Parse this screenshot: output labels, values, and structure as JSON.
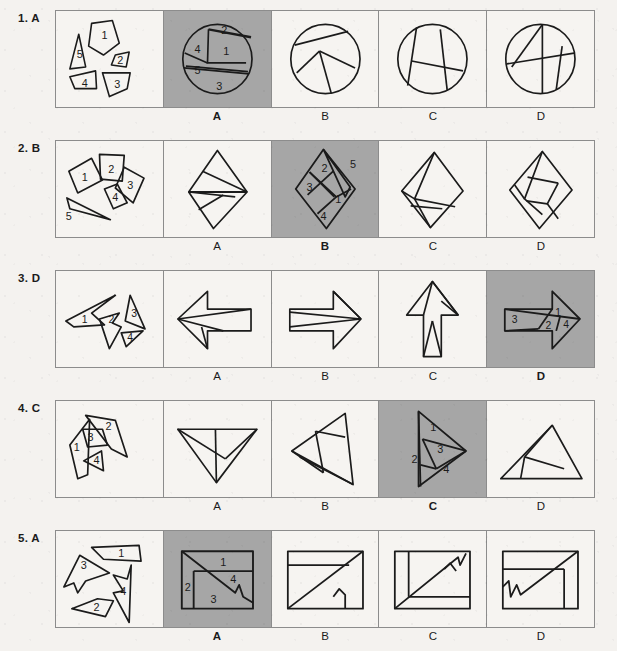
{
  "page": {
    "background_color": "#f4f2ef",
    "shaded_cell_color": "#a6a6a6",
    "line_color": "#1b1b1b",
    "option_letters": [
      "A",
      "B",
      "C",
      "D"
    ]
  },
  "rows": [
    {
      "number": "1.",
      "answer": "A",
      "label": "1. A",
      "pieces_count": 5,
      "piece_numbers": [
        "1",
        "2",
        "3",
        "4",
        "5"
      ],
      "outline_shape": "circle",
      "options": [
        {
          "letter": "A",
          "selected": true,
          "piece_numbers": [
            "1",
            "2",
            "3",
            "4",
            "5"
          ]
        },
        {
          "letter": "B",
          "selected": false,
          "piece_numbers": []
        },
        {
          "letter": "C",
          "selected": false,
          "piece_numbers": []
        },
        {
          "letter": "D",
          "selected": false,
          "piece_numbers": []
        }
      ]
    },
    {
      "number": "2.",
      "answer": "B",
      "label": "2. B",
      "pieces_count": 5,
      "piece_numbers": [
        "1",
        "2",
        "3",
        "4",
        "5"
      ],
      "outline_shape": "diamond",
      "options": [
        {
          "letter": "A",
          "selected": false,
          "piece_numbers": []
        },
        {
          "letter": "B",
          "selected": true,
          "piece_numbers": [
            "1",
            "2",
            "3",
            "4",
            "5"
          ]
        },
        {
          "letter": "C",
          "selected": false,
          "piece_numbers": []
        },
        {
          "letter": "D",
          "selected": false,
          "piece_numbers": []
        }
      ]
    },
    {
      "number": "3.",
      "answer": "D",
      "label": "3. D",
      "pieces_count": 4,
      "piece_numbers": [
        "1",
        "2",
        "3",
        "4"
      ],
      "outline_shape": "arrow",
      "options": [
        {
          "letter": "A",
          "selected": false,
          "piece_numbers": []
        },
        {
          "letter": "B",
          "selected": false,
          "piece_numbers": []
        },
        {
          "letter": "C",
          "selected": false,
          "piece_numbers": []
        },
        {
          "letter": "D",
          "selected": true,
          "piece_numbers": [
            "1",
            "2",
            "3",
            "4"
          ]
        }
      ]
    },
    {
      "number": "4.",
      "answer": "C",
      "label": "4. C",
      "pieces_count": 4,
      "piece_numbers": [
        "1",
        "2",
        "3",
        "4"
      ],
      "outline_shape": "triangle",
      "options": [
        {
          "letter": "A",
          "selected": false,
          "piece_numbers": []
        },
        {
          "letter": "B",
          "selected": false,
          "piece_numbers": []
        },
        {
          "letter": "C",
          "selected": true,
          "piece_numbers": [
            "1",
            "2",
            "3",
            "4"
          ]
        },
        {
          "letter": "D",
          "selected": false,
          "piece_numbers": []
        }
      ]
    },
    {
      "number": "5.",
      "answer": "A",
      "label": "5. A",
      "pieces_count": 4,
      "piece_numbers": [
        "1",
        "2",
        "3",
        "4"
      ],
      "outline_shape": "rectangle",
      "options": [
        {
          "letter": "A",
          "selected": true,
          "piece_numbers": [
            "1",
            "2",
            "3",
            "4"
          ]
        },
        {
          "letter": "B",
          "selected": false,
          "piece_numbers": []
        },
        {
          "letter": "C",
          "selected": false,
          "piece_numbers": []
        },
        {
          "letter": "D",
          "selected": false,
          "piece_numbers": []
        }
      ]
    }
  ]
}
